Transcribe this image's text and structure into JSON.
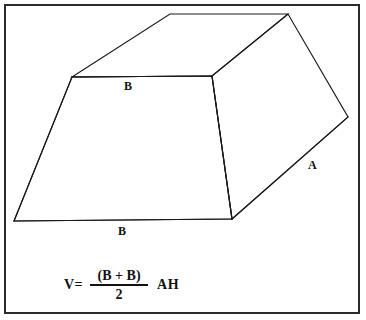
{
  "figure": {
    "shape_name": "trapezoidal-prism",
    "background_color": "#ffffff",
    "line_color": "#1a1a1a",
    "frame_color": "#2b2b2b",
    "labels": {
      "top_base": "B",
      "bottom_base": "B",
      "side_depth": "A"
    },
    "geometry": {
      "front_face_points": "14,221 72,77 212,76 232,219",
      "top_face_points": "72,77 170,14 288,14 212,76",
      "right_face_points": "212,76 288,14 348,117 232,219",
      "vertices": {
        "front_bottom_left": [
          14,
          221
        ],
        "front_top_left": [
          72,
          77
        ],
        "front_top_right": [
          212,
          76
        ],
        "front_bottom_right": [
          232,
          219
        ],
        "top_back_left": [
          170,
          14
        ],
        "top_back_right": [
          288,
          14
        ],
        "right_far": [
          348,
          117
        ]
      }
    }
  },
  "formula": {
    "lhs": "V=",
    "numerator": "(B + B)",
    "denominator": "2",
    "rhs": "AH",
    "plain_text": "V= (B + B) / 2  AH"
  }
}
